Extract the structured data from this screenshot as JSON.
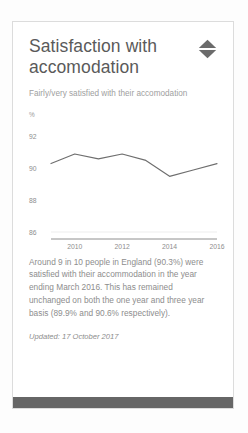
{
  "card": {
    "title": "Satisfaction with accomodation",
    "subtitle": "Fairly/very satisfied with their accomodation",
    "sort_icon": "sort-diamond-icon",
    "body": "Around 9 in 10 people in England (90.3%) were satisfied with their accommodation in the year ending March 2016. This has remained unchanged on both the one year and three year basis (89.9% and 90.6% respectively).",
    "updated": "Updated: 17 October 2017"
  },
  "colors": {
    "line": "#6e6e6e",
    "axis": "#8e8e8e",
    "grid": "#ededed",
    "title_text": "#5a5a5a",
    "muted_text": "#8d8d8d",
    "card_border": "#dcdcdc",
    "footer_bar": "#666666"
  },
  "chart_data": {
    "type": "line",
    "title": "",
    "xlabel": "",
    "ylabel": "%",
    "yunit_label": "%",
    "x": [
      2009,
      2010,
      2011,
      2012,
      2013,
      2014,
      2015,
      2016
    ],
    "values": [
      90.3,
      90.9,
      90.6,
      90.9,
      90.5,
      89.5,
      89.9,
      90.3
    ],
    "series": [
      {
        "name": "Fairly/very satisfied with their accomodation",
        "values": [
          90.3,
          90.9,
          90.6,
          90.9,
          90.5,
          89.5,
          89.9,
          90.3
        ]
      }
    ],
    "ylim": [
      86,
      92.6
    ],
    "yticks": [
      92,
      90,
      88,
      86
    ],
    "ytick_labels": [
      "92",
      "90",
      "88",
      "86"
    ],
    "xlim": [
      2009,
      2016
    ],
    "xticks": [
      2010,
      2012,
      2014,
      2016
    ],
    "xtick_labels": [
      "2010",
      "2012",
      "2014",
      "2016"
    ],
    "grid": false,
    "legend": "none"
  }
}
